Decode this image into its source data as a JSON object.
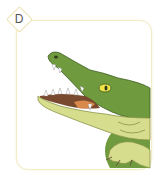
{
  "option": {
    "label": "D",
    "image": {
      "subject": "crocodile-open-mouth",
      "colors": {
        "body": "#6f9a3e",
        "body_dark": "#4f7a2a",
        "belly": "#d6dd8c",
        "mouth": "#7a4a2e",
        "tongue": "#d98a4a",
        "eye": "#f2e34a",
        "teeth": "#ffffff"
      }
    },
    "card_border_color": "#f3ecc6"
  }
}
